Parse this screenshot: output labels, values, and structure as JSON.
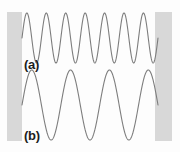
{
  "figure": {
    "background_color": "#fdfdfd",
    "width": 180,
    "height": 152
  },
  "walls": {
    "color": "#d8d8d8",
    "left": {
      "name": "left-wall",
      "x": 7,
      "y": 12,
      "width": 15,
      "height": 129
    },
    "right": {
      "name": "right-wall",
      "x": 155,
      "y": 12,
      "width": 17,
      "height": 129
    }
  },
  "labels": {
    "wave_a": "(a)",
    "wave_b": "(b)"
  },
  "chart_data": {
    "type": "line",
    "title": "",
    "xlabel": "",
    "ylabel": "",
    "grid": false,
    "legend": "none",
    "annotations": [
      "(a)",
      "(b)"
    ],
    "xlim": [
      22,
      158
    ],
    "ylim": [
      0,
      152
    ],
    "series": [
      {
        "name": "(a)",
        "waveform": "standing-wave",
        "cycles": 7,
        "harmonic": 14,
        "amplitude": 25,
        "baseline_y": 38,
        "x_start": 22,
        "x_end": 158,
        "color": "#7d7d7d",
        "line_width": 1.1
      },
      {
        "name": "(b)",
        "waveform": "standing-wave",
        "cycles": 3.5,
        "harmonic": 7,
        "amplitude": 35,
        "baseline_y": 105,
        "x_start": 22,
        "x_end": 158,
        "color": "#7d7d7d",
        "line_width": 1.1
      }
    ]
  }
}
